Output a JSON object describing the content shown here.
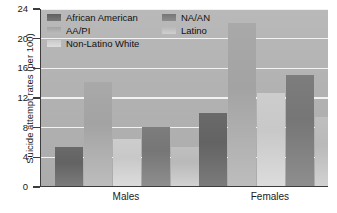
{
  "chart_data": {
    "type": "bar",
    "title": "",
    "xlabel": "",
    "ylabel": "Suicide attempt rates (per 100)",
    "categories": [
      "Males",
      "Females"
    ],
    "ylim": [
      0,
      24
    ],
    "yticks": [
      0,
      4,
      8,
      12,
      16,
      20,
      24
    ],
    "ytick_labels": [
      "0",
      "4",
      "8",
      "12",
      "16",
      "20",
      "24"
    ],
    "grid": "horizontal",
    "legend_position": "top-left-inside",
    "series": [
      {
        "name": "African American",
        "values": [
          5.3,
          9.9
        ],
        "color": "#666666"
      },
      {
        "name": "AA/PI",
        "values": [
          14.0,
          22.0
        ],
        "color": "#a6a6a6"
      },
      {
        "name": "Non-Latino White",
        "values": [
          6.3,
          12.5
        ],
        "color": "#cacaca"
      },
      {
        "name": "NA/AN",
        "values": [
          7.9,
          15.0
        ],
        "color": "#7a7a7a"
      },
      {
        "name": "Latino",
        "values": [
          5.3,
          9.3
        ],
        "color": "#bcbcbc"
      }
    ]
  },
  "colors": {
    "plot_background": "#b3b3b3",
    "gridline": "#f2f2f2",
    "axis": "#3c3c3c",
    "text": "#1a1a1a",
    "page_background": "#ffffff"
  }
}
